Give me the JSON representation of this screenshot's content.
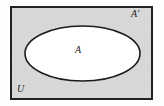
{
  "figure": {
    "type": "venn-diagram",
    "width": 164,
    "height": 106
  },
  "labels": {
    "universe": "U",
    "set": "A",
    "complement": "A′"
  },
  "regions": {
    "universe_rect": {
      "name": "universal-set-rectangle",
      "x": 11,
      "y": 7,
      "width": 141,
      "height": 92,
      "fill": "#d9d9d9",
      "stroke": "#232323",
      "stroke_width": 2
    },
    "set_ellipse": {
      "name": "set-a-ellipse",
      "cx": 82.5,
      "cy": 53.5,
      "rx": 57.5,
      "ry": 27.5,
      "fill": "#ffffff",
      "stroke": "#1c1c1c",
      "stroke_width": 1.6
    }
  },
  "colors": {
    "background": "#fefefe",
    "shaded_region": "#d9d9d9",
    "unshaded_region": "#ffffff",
    "outline": "#1f1f1f",
    "text": "#1b1b1b"
  }
}
